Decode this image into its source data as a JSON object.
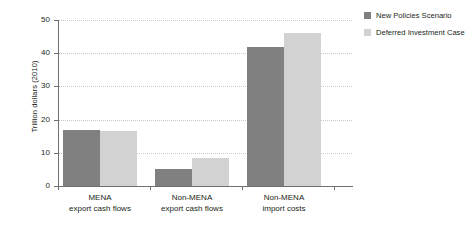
{
  "chart_data": {
    "type": "bar",
    "title": "",
    "subtitle": "",
    "xlabel": "",
    "ylabel": "Trillion dollars (2010)",
    "ylim": [
      0,
      50
    ],
    "ytick_labels": [
      "0",
      "10",
      "20",
      "30",
      "40",
      "50"
    ],
    "yticks": [
      0,
      10,
      20,
      30,
      40,
      50
    ],
    "grid": "horizontal-dotted",
    "legend_position": "right",
    "categories": [
      {
        "line1": "MENA",
        "line2": "export cash flows"
      },
      {
        "line1": "Non-MENA",
        "line2": "export cash flows"
      },
      {
        "line1": "Non-MENA",
        "line2": "import costs"
      }
    ],
    "series": [
      {
        "name": "New Policies Scenario",
        "color": "#808080",
        "values": [
          16.8,
          5.2,
          42.0
        ]
      },
      {
        "name": "Deferred Investment Case",
        "color": "#d2d2d2",
        "values": [
          16.5,
          8.4,
          46.0
        ]
      }
    ]
  },
  "legend": {
    "items": [
      {
        "label": "New Policies Scenario",
        "swatch": "#808080"
      },
      {
        "label": "Deferred Investment Case",
        "swatch": "#d2d2d2"
      }
    ]
  },
  "axis": {
    "y_title": "Trillion dollars (2010)"
  }
}
